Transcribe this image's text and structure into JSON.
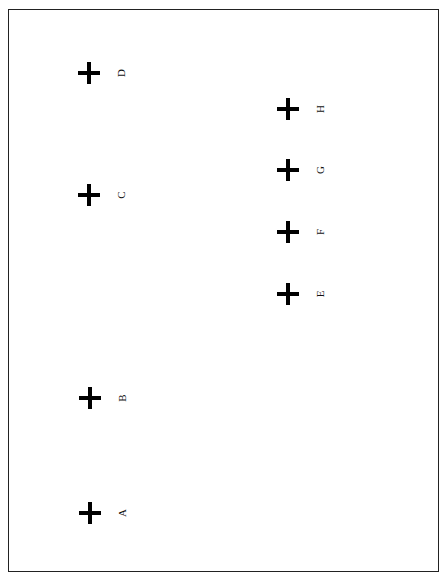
{
  "diagram": {
    "markers": [
      {
        "id": "A",
        "label": "A",
        "x": 90,
        "y": 513
      },
      {
        "id": "B",
        "label": "B",
        "x": 90,
        "y": 398
      },
      {
        "id": "C",
        "label": "C",
        "x": 89,
        "y": 195
      },
      {
        "id": "D",
        "label": "D",
        "x": 89,
        "y": 73
      },
      {
        "id": "E",
        "label": "E",
        "x": 288,
        "y": 294
      },
      {
        "id": "F",
        "label": "F",
        "x": 288,
        "y": 232
      },
      {
        "id": "G",
        "label": "G",
        "x": 288,
        "y": 170
      },
      {
        "id": "H",
        "label": "H",
        "x": 288,
        "y": 109
      }
    ]
  }
}
